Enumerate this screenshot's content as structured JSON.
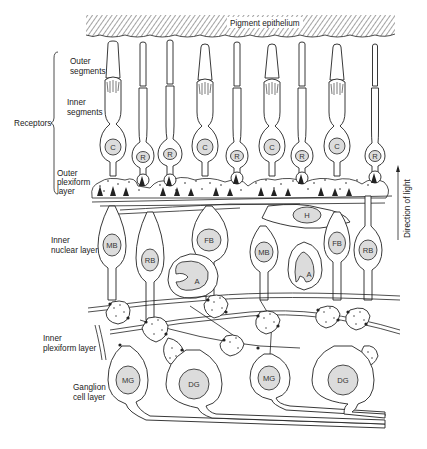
{
  "figure": {
    "pigment_layer_label": "Pigment epithelium",
    "direction_label": "Direction of light",
    "colors": {
      "ink": "#222222",
      "nucleus_fill": "#dcdcdc",
      "background": "#ffffff"
    }
  },
  "layer_labels": {
    "outer_segments": [
      "Outer",
      "segments"
    ],
    "inner_segments": [
      "Inner",
      "segments"
    ],
    "receptors": "Receptors",
    "outer_plexiform": [
      "Outer",
      "plexiform",
      "layer"
    ],
    "inner_nuclear": [
      "Inner",
      "nuclear layer"
    ],
    "inner_plexiform": [
      "Inner",
      "plexiform layer"
    ],
    "ganglion": [
      "Ganglion",
      "cell layer"
    ]
  },
  "receptors": [
    {
      "type": "C",
      "x": 113
    },
    {
      "type": "R",
      "x": 143
    },
    {
      "type": "R",
      "x": 170
    },
    {
      "type": "C",
      "x": 205
    },
    {
      "type": "R",
      "x": 237
    },
    {
      "type": "C",
      "x": 272
    },
    {
      "type": "R",
      "x": 302
    },
    {
      "type": "C",
      "x": 337
    },
    {
      "type": "R",
      "x": 375
    }
  ],
  "inner_nuclear_cells": [
    {
      "label": "H",
      "x": 307,
      "y": 215
    },
    {
      "label": "MB",
      "x": 112,
      "y": 245
    },
    {
      "label": "RB",
      "x": 150,
      "y": 260
    },
    {
      "label": "FB",
      "x": 209,
      "y": 240
    },
    {
      "label": "A",
      "x": 191,
      "y": 274
    },
    {
      "label": "MB",
      "x": 263,
      "y": 252
    },
    {
      "label": "A",
      "x": 304,
      "y": 270
    },
    {
      "label": "FB",
      "x": 337,
      "y": 243
    },
    {
      "label": "RB",
      "x": 368,
      "y": 250
    }
  ],
  "ganglion_cells": [
    {
      "label": "MG",
      "x": 127,
      "y": 380
    },
    {
      "label": "DG",
      "x": 193,
      "y": 383
    },
    {
      "label": "MG",
      "x": 268,
      "y": 378
    },
    {
      "label": "DG",
      "x": 342,
      "y": 380
    }
  ]
}
